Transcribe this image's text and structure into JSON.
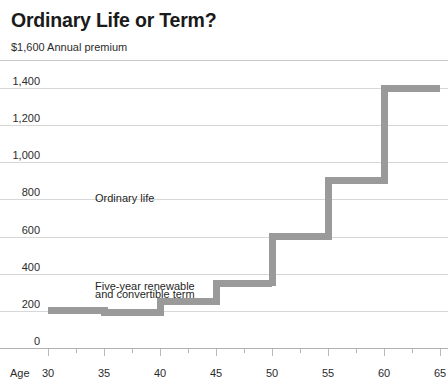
{
  "header": {
    "title": "Ordinary Life or Term?",
    "subtitle": "$1,600 Annual premium"
  },
  "annotations": {
    "ordinary_life": "Ordinary life",
    "term_line1": "Five-year renewable",
    "term_line2": "and convertible term"
  },
  "axis": {
    "x_name": "Age"
  },
  "chart_data": {
    "type": "line",
    "subtype": "step",
    "title": "Ordinary Life or Term?",
    "subtitle": "$1,600 Annual premium",
    "xlabel": "Age",
    "ylabel": "Annual premium",
    "xlim": [
      30,
      65
    ],
    "ylim": [
      0,
      1600
    ],
    "yticks": [
      0,
      200,
      400,
      600,
      800,
      1000,
      1200,
      1400
    ],
    "ytick_labels": [
      "0",
      "200",
      "400",
      "600",
      "800",
      "1,000",
      "1,200",
      "1,400"
    ],
    "xticks": [
      30,
      35,
      40,
      45,
      50,
      55,
      60,
      65
    ],
    "xtick_labels": [
      "30",
      "35",
      "40",
      "45",
      "50",
      "55",
      "60",
      "65"
    ],
    "x_minor_ticks": [
      32.5,
      37.5,
      42.5,
      47.5,
      52.5,
      57.5,
      62.5
    ],
    "grid": true,
    "grid_axis": "y",
    "legend": "none",
    "series_color": "#9a9a9a",
    "series": [
      {
        "name": "Five-year renewable and convertible term",
        "step_bands": [
          {
            "x_start": 30,
            "x_end": 35,
            "value": 200
          },
          {
            "x_start": 35,
            "x_end": 40,
            "value": 190
          },
          {
            "x_start": 40,
            "x_end": 45,
            "value": 250
          },
          {
            "x_start": 45,
            "x_end": 50,
            "value": 350
          },
          {
            "x_start": 50,
            "x_end": 55,
            "value": 600
          },
          {
            "x_start": 55,
            "x_end": 60,
            "value": 900
          },
          {
            "x_start": 60,
            "x_end": 65,
            "value": 1400
          }
        ]
      }
    ],
    "annotations": [
      {
        "text": "Ordinary life",
        "x": 34.2,
        "y": 800
      },
      {
        "text": "Five-year renewable",
        "x": 34.2,
        "y": 330
      },
      {
        "text": "and convertible term",
        "x": 34.2,
        "y": 285
      }
    ]
  }
}
